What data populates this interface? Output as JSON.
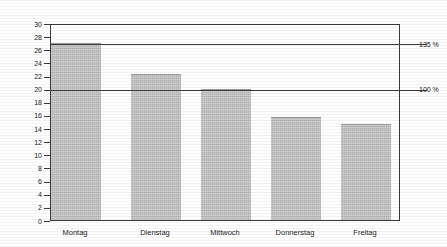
{
  "chart_data": {
    "type": "bar",
    "title": "",
    "xlabel": "",
    "ylabel": "Volumenanteil [%]",
    "categories": [
      "Montag",
      "Dienstag",
      "Mittwoch",
      "Donnerstag",
      "Freitag"
    ],
    "values": [
      26.9,
      22.2,
      20.0,
      15.7,
      14.6
    ],
    "ylim": [
      0,
      30
    ],
    "ytick_values": [
      0,
      2,
      4,
      6,
      8,
      10,
      12,
      14,
      16,
      18,
      20,
      22,
      24,
      26,
      28,
      30
    ],
    "ytick_labels": [
      "0",
      "2",
      "4",
      "6",
      "8",
      "10",
      "12",
      "14",
      "16",
      "18",
      "20",
      "22",
      "24",
      "26",
      "28",
      "30"
    ],
    "grid": false,
    "legend": null,
    "bar_color": "#b5b5b5",
    "axis_color": "#3a3a3a",
    "reference_lines": [
      {
        "value": 26.9,
        "label": "135 %"
      },
      {
        "value": 20.0,
        "label": "100 %"
      }
    ],
    "annotations": []
  }
}
